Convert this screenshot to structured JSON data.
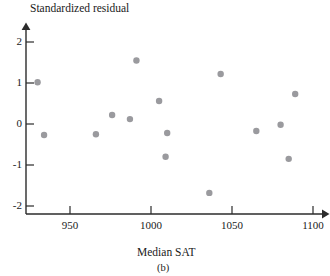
{
  "figure": {
    "caption": "(b)",
    "y_axis_title": "Standardized residual",
    "x_axis_title": "Median SAT"
  },
  "chart_data": {
    "type": "scatter",
    "title": "",
    "xlabel": "Median SAT",
    "ylabel": "Standardized residual",
    "caption": "(b)",
    "xlim": [
      920,
      1105
    ],
    "ylim": [
      -2.35,
      2.3
    ],
    "xticks": [
      950,
      1000,
      1050,
      1100
    ],
    "xtick_labels": [
      "950",
      "1000",
      "1050",
      "1100"
    ],
    "yticks": [
      -2,
      -1,
      0,
      1,
      2
    ],
    "ytick_labels": [
      "-2",
      "-1",
      "0",
      "1",
      "2"
    ],
    "grid": false,
    "legend": false,
    "marker_color": "#9a9a9e",
    "marker_size": 3.2,
    "axis_color": "#2b2b2b",
    "points": [
      {
        "x": 930,
        "y": 1.02
      },
      {
        "x": 934,
        "y": -0.27
      },
      {
        "x": 966,
        "y": -0.25
      },
      {
        "x": 976,
        "y": 0.22
      },
      {
        "x": 987,
        "y": 0.12
      },
      {
        "x": 991,
        "y": 1.55
      },
      {
        "x": 1005,
        "y": 0.56
      },
      {
        "x": 1010,
        "y": -0.22
      },
      {
        "x": 1009,
        "y": -0.8
      },
      {
        "x": 1036,
        "y": -1.68
      },
      {
        "x": 1043,
        "y": 1.22
      },
      {
        "x": 1065,
        "y": -0.17
      },
      {
        "x": 1080,
        "y": -0.02
      },
      {
        "x": 1085,
        "y": -0.85
      },
      {
        "x": 1089,
        "y": 0.73
      }
    ]
  }
}
